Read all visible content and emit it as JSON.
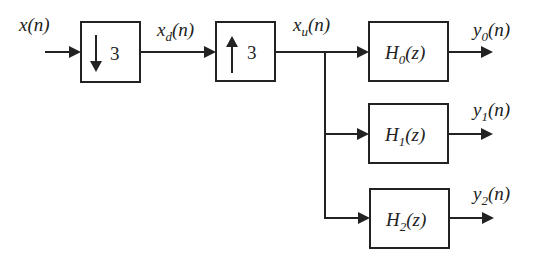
{
  "signals": {
    "input": {
      "base": "x",
      "sub": "",
      "arg": "(n)"
    },
    "decimated": {
      "base": "x",
      "sub": "d",
      "arg": "(n)"
    },
    "upsampled": {
      "base": "x",
      "sub": "u",
      "arg": "(n)"
    },
    "outputs": [
      {
        "base": "y",
        "sub": "0",
        "arg": "(n)"
      },
      {
        "base": "y",
        "sub": "1",
        "arg": "(n)"
      },
      {
        "base": "y",
        "sub": "2",
        "arg": "(n)"
      }
    ]
  },
  "blocks": {
    "downsampler": {
      "arrow": "down",
      "factor": "3"
    },
    "upsampler": {
      "arrow": "up",
      "factor": "3"
    },
    "filters": [
      {
        "base": "H",
        "sub": "0",
        "arg": "(z)"
      },
      {
        "base": "H",
        "sub": "1",
        "arg": "(z)"
      },
      {
        "base": "H",
        "sub": "2",
        "arg": "(z)"
      }
    ]
  },
  "colors": {
    "stroke": "#222222",
    "background": "#ffffff"
  }
}
